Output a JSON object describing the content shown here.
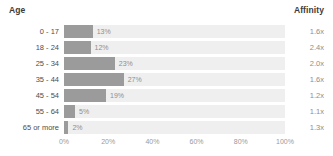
{
  "header": {
    "left_label": "Age",
    "right_label": "Affinity"
  },
  "axis": {
    "ticks": [
      "0%",
      "20%",
      "40%",
      "60%",
      "80%",
      "100%"
    ]
  },
  "colors": {
    "bar": "#9b9b9b",
    "track": "#efefef",
    "label": "#4d4d4d",
    "value": "#8e8e8e",
    "header": "#3b3b3b"
  },
  "rows": [
    {
      "label": "0 - 17",
      "value": 13,
      "value_label": "13%",
      "affinity": "1.6x"
    },
    {
      "label": "18 - 24",
      "value": 12,
      "value_label": "12%",
      "affinity": "2.4x"
    },
    {
      "label": "25 - 34",
      "value": 23,
      "value_label": "23%",
      "affinity": "2.0x"
    },
    {
      "label": "35 - 44",
      "value": 27,
      "value_label": "27%",
      "affinity": "1.6x"
    },
    {
      "label": "45 - 54",
      "value": 19,
      "value_label": "19%",
      "affinity": "1.2x"
    },
    {
      "label": "55 - 64",
      "value": 5,
      "value_label": "5%",
      "affinity": "1.1x"
    },
    {
      "label": "65 or more",
      "value": 2,
      "value_label": "2%",
      "affinity": "1.3x"
    }
  ],
  "chart_data": {
    "type": "bar",
    "title": "Age",
    "orientation": "horizontal",
    "xlabel": "",
    "ylabel": "Age",
    "xlim": [
      0,
      100
    ],
    "grid": false,
    "legend": "none",
    "categories": [
      "0 - 17",
      "18 - 24",
      "25 - 34",
      "35 - 44",
      "45 - 54",
      "55 - 64",
      "65 or more"
    ],
    "values": [
      13,
      12,
      23,
      27,
      19,
      5,
      2
    ],
    "value_labels": [
      "13%",
      "12%",
      "23%",
      "27%",
      "19%",
      "5%",
      "2%"
    ],
    "tick_labels": [
      "0%",
      "20%",
      "40%",
      "60%",
      "80%",
      "100%"
    ],
    "series": [
      {
        "name": "Percent",
        "values": [
          13,
          12,
          23,
          27,
          19,
          5,
          2
        ]
      },
      {
        "name": "Affinity",
        "values": [
          1.6,
          2.4,
          2.0,
          1.6,
          1.2,
          1.1,
          1.3
        ]
      }
    ],
    "annotations": [
      "Affinity"
    ]
  }
}
